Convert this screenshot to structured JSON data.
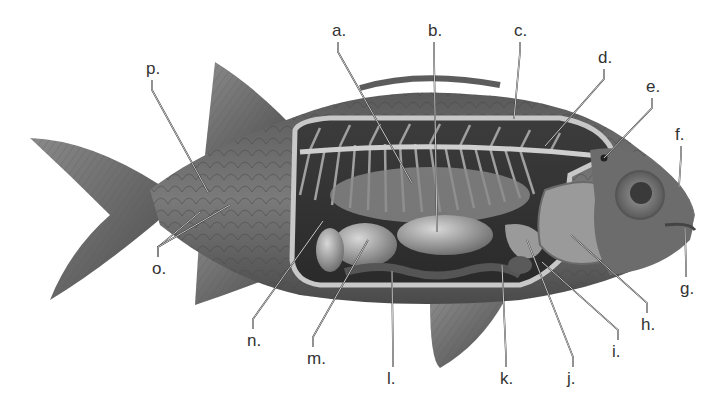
{
  "diagram": {
    "label_count": 16,
    "colors": {
      "background": "#ffffff",
      "body_dark": "#3a3a3a",
      "body_mid": "#6e6e6e",
      "body_light": "#a8a8a8",
      "label_text": "#333333"
    },
    "labels": [
      {
        "id": "a",
        "text": "a.",
        "x": 332,
        "y": 36,
        "target": [
          412,
          183
        ]
      },
      {
        "id": "b",
        "text": "b.",
        "x": 428,
        "y": 36,
        "target": [
          437,
          232
        ]
      },
      {
        "id": "c",
        "text": "c.",
        "x": 514,
        "y": 36,
        "target": [
          514,
          119
        ]
      },
      {
        "id": "d",
        "text": "d.",
        "x": 598,
        "y": 63,
        "target": [
          545,
          146
        ]
      },
      {
        "id": "e",
        "text": "e.",
        "x": 646,
        "y": 92,
        "target": [
          604,
          158
        ]
      },
      {
        "id": "f",
        "text": "f.",
        "x": 675,
        "y": 140,
        "target": [
          679,
          187
        ]
      },
      {
        "id": "g",
        "text": "g.",
        "x": 680,
        "y": 294,
        "target": [
          685,
          228
        ]
      },
      {
        "id": "h",
        "text": "h.",
        "x": 641,
        "y": 330,
        "target": [
          571,
          235
        ]
      },
      {
        "id": "i",
        "text": "i.",
        "x": 612,
        "y": 357,
        "target": [
          542,
          262
        ]
      },
      {
        "id": "j",
        "text": "j.",
        "x": 567,
        "y": 384,
        "target": [
          527,
          240
        ]
      },
      {
        "id": "k",
        "text": "k.",
        "x": 500,
        "y": 384,
        "target": [
          502,
          265
        ]
      },
      {
        "id": "l",
        "text": "l.",
        "x": 387,
        "y": 384,
        "target": [
          392,
          271
        ]
      },
      {
        "id": "m",
        "text": "m.",
        "x": 307,
        "y": 364,
        "target": [
          368,
          240
        ]
      },
      {
        "id": "n",
        "text": "n.",
        "x": 247,
        "y": 346,
        "target": [
          323,
          221
        ]
      },
      {
        "id": "o",
        "text": "o.",
        "x": 152,
        "y": 274,
        "target": [
          [
            200,
            212
          ],
          [
            230,
            205
          ]
        ]
      },
      {
        "id": "p",
        "text": "p.",
        "x": 146,
        "y": 74,
        "target": [
          208,
          192
        ]
      }
    ]
  }
}
